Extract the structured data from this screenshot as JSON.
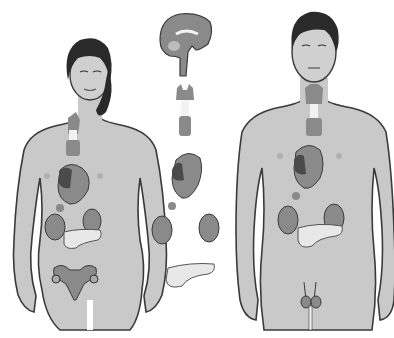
{
  "figure": {
    "colors": {
      "background": "#ffffff",
      "skin": "#c9c9c9",
      "skin_light": "#d6d6d6",
      "outline": "#3a3a3a",
      "hair": "#2a2a2a",
      "gland": "#8a8a8a",
      "gland_dark": "#4a4a4a",
      "pancreas": "#e4e4e4",
      "trachea": "#f2f2f2"
    },
    "figures": [
      {
        "name": "female-figure",
        "organs": [
          "thyroid",
          "thymus",
          "heart",
          "adrenal",
          "kidneys",
          "pancreas",
          "uterus-ovaries"
        ]
      },
      {
        "name": "glands-column",
        "organs": [
          "brain-pituitary",
          "thyroid-thymus",
          "heart",
          "kidneys-adrenal",
          "pancreas"
        ]
      },
      {
        "name": "male-figure",
        "organs": [
          "thyroid",
          "thymus",
          "heart",
          "adrenal",
          "kidneys",
          "pancreas",
          "testes"
        ]
      }
    ]
  }
}
